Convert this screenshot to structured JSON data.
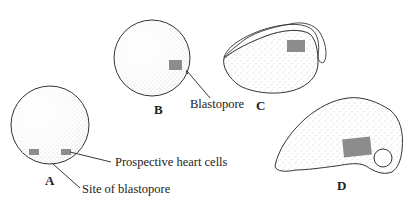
{
  "figure": {
    "stages": [
      {
        "id": "A",
        "label": "A"
      },
      {
        "id": "B",
        "label": "B"
      },
      {
        "id": "C",
        "label": "C"
      },
      {
        "id": "D",
        "label": "D"
      }
    ],
    "annotations": {
      "prospective_heart_cells": "Prospective heart cells",
      "site_of_blastopore": "Site of blastopore",
      "blastopore": "Blastopore"
    },
    "colors": {
      "outline": "#333333",
      "stipple": "#8a8a8a",
      "heart_cells": "#8c8c8c",
      "background": "#ffffff"
    }
  }
}
